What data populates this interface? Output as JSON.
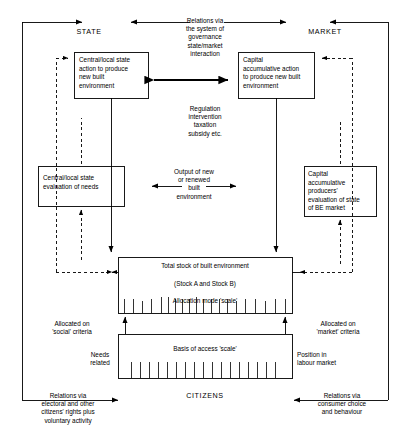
{
  "diagram": {
    "title_state": "STATE",
    "title_market": "MARKET",
    "title_citizens": "CITIZENS",
    "boxes": {
      "state_action": "Central/local state\naction to produce\nnew built\nenvironment",
      "market_action": "Capital\naccumulative action\nto produce new built\nenvironment",
      "state_eval": "Central/local state\nevaluation of needs",
      "market_eval": "Capital\naccumulative\nproducers'\nevaluation of  state\nof BE market",
      "stock_line1": "Total stock of built environment",
      "stock_line2": "(Stock A and Stock B)",
      "stock_line3": "Allocation mode 'scale'",
      "access_scale": "Basis of access 'scale'"
    },
    "labels": {
      "governance": "Relations via\nthe system of\ngovernance\nstate/market\ninteraction",
      "regulation": "Regulation\nintervention\ntaxation\nsubsidy etc.",
      "output": "Output of new\nor renewed\nbuilt\nenvironment",
      "allocated_social": "Allocated on\n'social' criteria",
      "allocated_market": "Allocated on\n'market' criteria",
      "needs_related": "Needs\nrelated",
      "position_labour": "Position in\nlabour market",
      "relations_citizens": "Relations via\nelectoral and other\ncitizens' rights plus\nvoluntary activity",
      "relations_consumer": "Relations via\nconsumer choice\nand behaviour"
    },
    "colors": {
      "line": "#000000",
      "background": "#ffffff"
    }
  }
}
